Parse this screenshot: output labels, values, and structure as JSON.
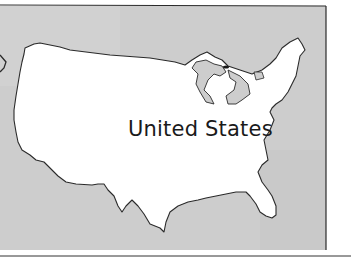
{
  "map": {
    "country_label": "United States",
    "colors": {
      "water": "#cfcfcf",
      "land": "#ffffff",
      "border": "#2a2a2a"
    }
  }
}
